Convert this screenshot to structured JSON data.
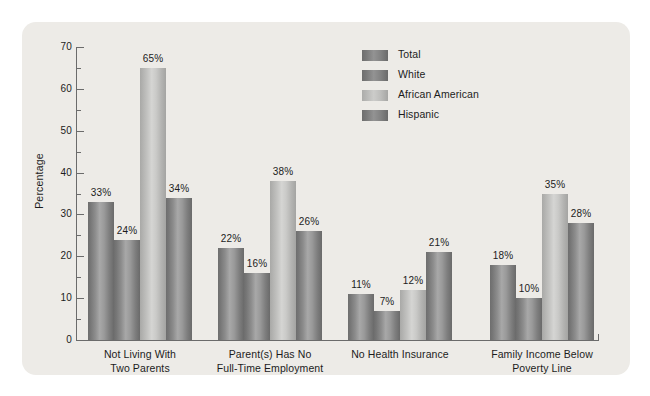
{
  "chart_data": {
    "type": "bar",
    "title": "",
    "xlabel": "",
    "ylabel": "Percentage",
    "ylim": [
      0,
      70
    ],
    "ytick_step": 10,
    "yminor_step": 5,
    "grid": false,
    "legend_position": "top-center-right",
    "value_suffix": "%",
    "categories": [
      "Not Living With Two Parents",
      "Parent(s) Has No Full-Time Employment",
      "No Health Insurance",
      "Family Income Below Poverty Line"
    ],
    "category_lines": [
      [
        "Not Living With",
        "Two Parents"
      ],
      [
        "Parent(s) Has No",
        "Full-Time Employment"
      ],
      [
        "No Health Insurance"
      ],
      [
        "Family Income Below",
        "Poverty Line"
      ]
    ],
    "series": [
      {
        "name": "Total",
        "values": [
          33,
          22,
          11,
          18
        ],
        "labels": [
          "33%",
          "22%",
          "11%",
          "18%"
        ]
      },
      {
        "name": "White",
        "values": [
          24,
          16,
          7,
          10
        ],
        "labels": [
          "24%",
          "16%",
          "7%",
          "10%"
        ]
      },
      {
        "name": "African American",
        "values": [
          65,
          38,
          12,
          35
        ],
        "labels": [
          "65%",
          "38%",
          "12%",
          "35%"
        ]
      },
      {
        "name": "Hispanic",
        "values": [
          34,
          26,
          21,
          28
        ],
        "labels": [
          "34%",
          "26%",
          "21%",
          "28%"
        ]
      }
    ],
    "ytick_labels": [
      "0",
      "10",
      "20",
      "30",
      "40",
      "50",
      "60",
      "70"
    ]
  },
  "axes": {
    "y_title": "Percentage",
    "y_ticks": [
      {
        "value": 70,
        "label": "70"
      },
      {
        "value": 60,
        "label": "60"
      },
      {
        "value": 50,
        "label": "50"
      },
      {
        "value": 40,
        "label": "40"
      },
      {
        "value": 30,
        "label": "30"
      },
      {
        "value": 20,
        "label": "20"
      },
      {
        "value": 10,
        "label": "10"
      },
      {
        "value": 0,
        "label": "0"
      }
    ]
  },
  "legend": {
    "items": [
      {
        "label": "Total"
      },
      {
        "label": "White"
      },
      {
        "label": "African American"
      },
      {
        "label": "Hispanic"
      }
    ]
  },
  "colors": {
    "panel_background": "#edebe7",
    "page_background": "#ffffff",
    "axis": "#6b6b6b",
    "text": "#1c1c1c",
    "bar_dark": "#7e7e7e",
    "bar_light": "#c4c4c2"
  }
}
